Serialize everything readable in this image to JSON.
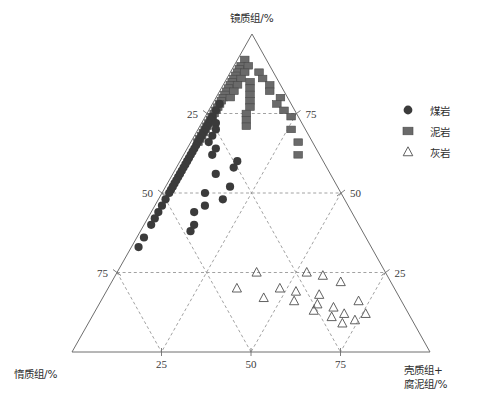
{
  "chart_data": {
    "type": "scatter",
    "plot_kind": "ternary",
    "title": "",
    "vertices": {
      "top": "镜质组/%",
      "bottom_left": "惰质组/%",
      "bottom_right_line1": "壳质组+",
      "bottom_right_line2": "腐泥组/%"
    },
    "axes": {
      "top_component": "镜质组/%",
      "left_component": "惰质组/%",
      "right_component": "壳质组+腐泥组/%",
      "range": [
        0,
        100
      ],
      "grid": true,
      "tick_step": 25
    },
    "ticks": {
      "left_axis": [
        "25",
        "50",
        "75"
      ],
      "right_axis": [
        "75",
        "50",
        "25"
      ],
      "bottom_axis": [
        "25",
        "50",
        "75"
      ]
    },
    "legend": {
      "position": "top-right",
      "entries": [
        {
          "label": "煤岩",
          "marker": "circle",
          "color": "#3b3b3b"
        },
        {
          "label": "泥岩",
          "marker": "square",
          "color": "#6a6a6a"
        },
        {
          "label": "灰岩",
          "marker": "triangle",
          "color": "#4f4f4f"
        }
      ]
    },
    "series": [
      {
        "name": "煤岩",
        "marker": "circle",
        "color": "#3b3b3b",
        "points": [
          [
            78,
            20,
            2
          ],
          [
            76,
            22,
            2
          ],
          [
            74,
            24,
            2
          ],
          [
            73,
            25,
            2
          ],
          [
            72,
            26,
            2
          ],
          [
            71,
            27,
            2
          ],
          [
            70,
            28,
            2
          ],
          [
            72,
            24,
            4
          ],
          [
            69,
            29,
            2
          ],
          [
            68,
            30,
            2
          ],
          [
            70,
            25,
            5
          ],
          [
            67,
            31,
            2
          ],
          [
            66,
            32,
            2
          ],
          [
            68,
            27,
            5
          ],
          [
            65,
            33,
            2
          ],
          [
            64,
            34,
            2
          ],
          [
            66,
            29,
            5
          ],
          [
            63,
            35,
            2
          ],
          [
            62,
            36,
            2
          ],
          [
            61,
            37,
            2
          ],
          [
            60,
            38,
            2
          ],
          [
            64,
            28,
            8
          ],
          [
            59,
            39,
            2
          ],
          [
            58,
            40,
            2
          ],
          [
            57,
            41,
            2
          ],
          [
            62,
            30,
            8
          ],
          [
            56,
            42,
            2
          ],
          [
            55,
            43,
            2
          ],
          [
            54,
            44,
            2
          ],
          [
            53,
            45,
            2
          ],
          [
            52,
            46,
            2
          ],
          [
            51,
            47,
            2
          ],
          [
            50,
            48,
            2
          ],
          [
            48,
            50,
            2
          ],
          [
            46,
            52,
            2
          ],
          [
            44,
            54,
            2
          ],
          [
            42,
            56,
            2
          ],
          [
            40,
            58,
            2
          ],
          [
            36,
            62,
            2
          ],
          [
            33,
            65,
            2
          ],
          [
            56,
            32,
            12
          ],
          [
            50,
            38,
            12
          ],
          [
            46,
            40,
            14
          ],
          [
            44,
            44,
            12
          ],
          [
            40,
            46,
            14
          ],
          [
            58,
            26,
            16
          ],
          [
            52,
            30,
            18
          ],
          [
            48,
            34,
            18
          ],
          [
            38,
            48,
            14
          ],
          [
            60,
            24,
            16
          ]
        ]
      },
      {
        "name": "泥岩",
        "marker": "square",
        "color": "#6a6a6a",
        "points": [
          [
            92,
            6,
            2
          ],
          [
            90,
            8,
            2
          ],
          [
            89,
            9,
            2
          ],
          [
            88,
            10,
            2
          ],
          [
            90,
            6,
            4
          ],
          [
            87,
            11,
            2
          ],
          [
            86,
            12,
            2
          ],
          [
            88,
            8,
            4
          ],
          [
            85,
            13,
            2
          ],
          [
            84,
            14,
            2
          ],
          [
            86,
            10,
            4
          ],
          [
            83,
            15,
            2
          ],
          [
            82,
            16,
            2
          ],
          [
            84,
            12,
            4
          ],
          [
            81,
            17,
            2
          ],
          [
            80,
            18,
            2
          ],
          [
            82,
            14,
            4
          ],
          [
            79,
            19,
            2
          ],
          [
            78,
            20,
            2
          ],
          [
            80,
            16,
            4
          ],
          [
            77,
            21,
            2
          ],
          [
            76,
            22,
            2
          ],
          [
            75,
            23,
            2
          ],
          [
            74,
            24,
            2
          ],
          [
            73,
            25,
            2
          ],
          [
            72,
            26,
            2
          ],
          [
            71,
            27,
            2
          ],
          [
            70,
            28,
            2
          ],
          [
            69,
            29,
            2
          ],
          [
            68,
            30,
            2
          ],
          [
            67,
            31,
            2
          ],
          [
            66,
            32,
            2
          ],
          [
            88,
            4,
            8
          ],
          [
            86,
            4,
            10
          ],
          [
            84,
            3,
            13
          ],
          [
            82,
            4,
            14
          ],
          [
            80,
            2,
            18
          ],
          [
            78,
            4,
            18
          ],
          [
            76,
            3,
            21
          ],
          [
            74,
            2,
            24
          ],
          [
            70,
            4,
            26
          ],
          [
            66,
            4,
            30
          ],
          [
            62,
            6,
            32
          ],
          [
            85,
            8,
            7
          ],
          [
            83,
            9,
            8
          ],
          [
            81,
            10,
            9
          ],
          [
            79,
            11,
            10
          ],
          [
            77,
            12,
            11
          ],
          [
            75,
            14,
            11
          ],
          [
            73,
            15,
            12
          ],
          [
            71,
            16,
            13
          ]
        ]
      },
      {
        "name": "灰岩",
        "marker": "triangle",
        "color": "#4f4f4f",
        "points": [
          [
            25,
            36,
            39
          ],
          [
            25,
            22,
            53
          ],
          [
            20,
            44,
            36
          ],
          [
            20,
            32,
            48
          ],
          [
            19,
            28,
            53
          ],
          [
            18,
            22,
            60
          ],
          [
            17,
            38,
            45
          ],
          [
            16,
            30,
            54
          ],
          [
            15,
            24,
            61
          ],
          [
            14,
            20,
            66
          ],
          [
            13,
            26,
            61
          ],
          [
            12,
            18,
            70
          ],
          [
            11,
            22,
            67
          ],
          [
            10,
            16,
            74
          ],
          [
            9,
            20,
            71
          ],
          [
            24,
            18,
            58
          ],
          [
            22,
            14,
            64
          ],
          [
            16,
            12,
            72
          ],
          [
            12,
            12,
            76
          ]
        ]
      }
    ]
  }
}
